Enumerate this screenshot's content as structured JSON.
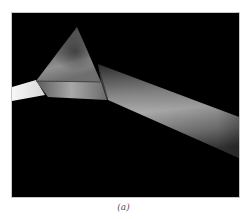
{
  "figure": {
    "caption": "(a)",
    "colors": {
      "background": "#000000",
      "page": "#ffffff",
      "beam_in": "#f2f2f2",
      "beam_out": "#9a9a9a",
      "prism": "#7a7a7a"
    }
  }
}
